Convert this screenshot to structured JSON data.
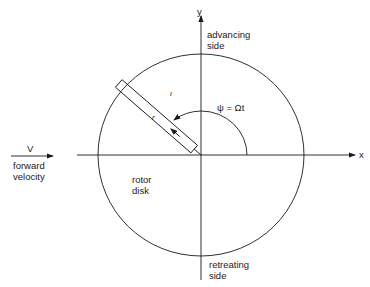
{
  "diagram": {
    "type": "rotor disk coordinate diagram",
    "axes": {
      "x_label": "x",
      "y_label": "y"
    },
    "labels": {
      "advancing_side": "advancing\nside",
      "retreating_side": "retreating\nside",
      "rotor_disk": "rotor\ndisk",
      "velocity_symbol": "V",
      "forward_velocity": "forward\nvelocity",
      "azimuth": "ψ = Ωt",
      "radial": "r",
      "blade_mark": "ι"
    },
    "colors": {
      "line": "#1a1a1a",
      "background": "#ffffff"
    }
  }
}
